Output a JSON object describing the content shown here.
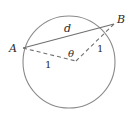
{
  "diagram": {
    "colors": {
      "stroke": "#7a7a7a",
      "text": "#2a2a2a",
      "background": "#ffffff"
    },
    "circle": {
      "cx": 69,
      "cy": 62,
      "r": 46
    },
    "points": {
      "A": {
        "label": "A",
        "x": 23,
        "y": 48
      },
      "B": {
        "label": "B",
        "x": 114,
        "y": 24
      },
      "O": {
        "x": 76,
        "y": 61
      }
    },
    "chord": {
      "label": "d"
    },
    "angle": {
      "label": "θ"
    },
    "radius_left": {
      "label": "1"
    },
    "radius_right": {
      "label": "1"
    }
  }
}
